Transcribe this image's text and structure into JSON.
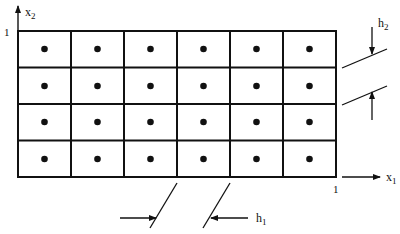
{
  "diagram": {
    "type": "uniform-grid-cell-centers",
    "grid": {
      "columns": 6,
      "rows": 4,
      "cell_centers_marked": true
    },
    "axes": {
      "x_label": "x",
      "x_subscript": "1",
      "y_label": "x",
      "y_subscript": "2",
      "x_max_label": "1",
      "y_max_label": "1"
    },
    "annotations": {
      "h1": {
        "label": "h",
        "subscript": "1",
        "meaning": "horizontal cell width"
      },
      "h2": {
        "label": "h",
        "subscript": "2",
        "meaning": "vertical cell height"
      }
    },
    "colors": {
      "line": "#111111",
      "background": "#ffffff"
    }
  }
}
